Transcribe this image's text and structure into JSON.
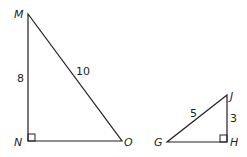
{
  "triangles": [
    {
      "name": "MNO",
      "vertices": {
        "M": "M",
        "N": "N",
        "O": "O"
      },
      "sides": {
        "MN": "8",
        "MO": "10"
      },
      "right_angle_at": "N"
    },
    {
      "name": "GHJ",
      "vertices": {
        "G": "G",
        "H": "H",
        "J": "J"
      },
      "sides": {
        "GJ": "5",
        "JH": "3"
      },
      "right_angle_at": "H"
    }
  ],
  "colors": {
    "stroke": "#231f20",
    "background": "#ffffff"
  }
}
